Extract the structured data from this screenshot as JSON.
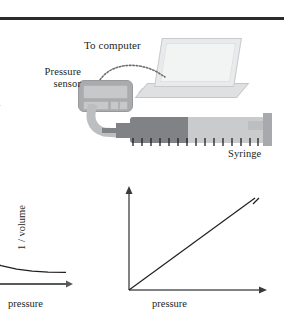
{
  "figure": {
    "title_rule": "horizontal-rule",
    "labels": {
      "to_computer": "To computer",
      "pressure_sensor": "Pressure\nsensor",
      "pressure_sensor_line1": "Pressure",
      "pressure_sensor_line2": "sensor",
      "syringe": "Syringe"
    },
    "margin_fragments": {
      "upper": ".",
      "lower": "r."
    },
    "apparatus": {
      "laptop": "laptop-computer",
      "cable": "dotted-data-cable",
      "sensor": "pressure-sensor-device",
      "tube": "flexible-tubing",
      "syringe": "gas-syringe"
    },
    "colors": {
      "rule": "#2b2b2b",
      "sensor_body": "#a9abad",
      "syringe_dark": "#808285",
      "syringe_light": "#c9cbcd",
      "laptop_screen": "#e9eaeb",
      "axis": "#58595b",
      "curve": "#231f20"
    }
  },
  "chart_data": [
    {
      "type": "line",
      "id": "volume-vs-pressure",
      "title": "",
      "xlabel": "pressure",
      "ylabel": "volume",
      "relationship": "inverse",
      "note": "hyperbolic decay curve, partially cropped at left edge",
      "grid": false,
      "legend": false,
      "xlim": [
        0,
        10
      ],
      "ylim": [
        0,
        10
      ],
      "x": [
        0.2,
        0.6,
        1.2,
        2.0,
        3.0,
        4.2,
        5.6,
        7.0,
        8.4,
        10.0
      ],
      "y": [
        9.6,
        8.2,
        6.2,
        4.6,
        3.4,
        2.7,
        2.2,
        1.9,
        1.75,
        1.7
      ]
    },
    {
      "type": "line",
      "id": "inverse-volume-vs-pressure",
      "title": "",
      "xlabel": "pressure",
      "ylabel": "1 / volume",
      "relationship": "directly proportional",
      "note": "straight line through the origin",
      "grid": false,
      "legend": false,
      "xlim": [
        0,
        10
      ],
      "ylim": [
        0,
        10
      ],
      "x": [
        0,
        2,
        4,
        6,
        8,
        10
      ],
      "y": [
        0,
        2,
        4,
        6,
        8,
        10
      ]
    }
  ]
}
